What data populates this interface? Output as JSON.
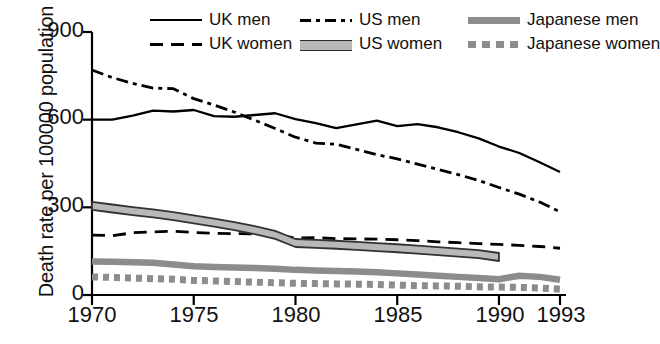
{
  "chart_data": {
    "type": "line",
    "title": "",
    "xlabel": "",
    "ylabel": "Death rate per 100000 population",
    "xlim": [
      1970,
      1993
    ],
    "ylim": [
      0,
      900
    ],
    "yticks": [
      0,
      300,
      600,
      900
    ],
    "xticks": [
      1970,
      1975,
      1980,
      1985,
      1990,
      1993
    ],
    "grid": false,
    "legend_position": "top",
    "series": [
      {
        "name": "UK men",
        "style": "solid",
        "color": "#000000",
        "x": [
          1970,
          1971,
          1972,
          1973,
          1974,
          1975,
          1976,
          1977,
          1978,
          1979,
          1980,
          1981,
          1982,
          1983,
          1984,
          1985,
          1986,
          1987,
          1988,
          1989,
          1990,
          1991,
          1992,
          1993
        ],
        "values": [
          600,
          600,
          614,
          631,
          628,
          633,
          612,
          610,
          616,
          622,
          602,
          588,
          571,
          584,
          597,
          578,
          585,
          574,
          557,
          536,
          508,
          486,
          454,
          421
        ]
      },
      {
        "name": "UK women",
        "style": "dashed",
        "color": "#000000",
        "x": [
          1970,
          1971,
          1972,
          1973,
          1974,
          1975,
          1976,
          1977,
          1978,
          1979,
          1980,
          1981,
          1982,
          1983,
          1984,
          1985,
          1986,
          1987,
          1988,
          1989,
          1990,
          1991,
          1992,
          1993
        ],
        "values": [
          205,
          203,
          213,
          216,
          218,
          214,
          211,
          210,
          209,
          206,
          195,
          196,
          193,
          192,
          191,
          189,
          186,
          182,
          179,
          176,
          173,
          170,
          166,
          160
        ]
      },
      {
        "name": "US men",
        "style": "dashdot",
        "color": "#000000",
        "x": [
          1970,
          1971,
          1972,
          1973,
          1974,
          1975,
          1976,
          1977,
          1978,
          1979,
          1980,
          1981,
          1982,
          1983,
          1984,
          1985,
          1986,
          1987,
          1988,
          1989,
          1990,
          1991,
          1992,
          1993
        ],
        "values": [
          770,
          744,
          724,
          708,
          706,
          672,
          650,
          626,
          598,
          570,
          540,
          520,
          516,
          498,
          480,
          466,
          448,
          430,
          412,
          392,
          368,
          345,
          318,
          285
        ]
      },
      {
        "name": "US women",
        "style": "band",
        "color": "#b8b8b8",
        "x": [
          1970,
          1971,
          1972,
          1973,
          1974,
          1975,
          1976,
          1977,
          1978,
          1979,
          1980,
          1981,
          1982,
          1983,
          1984,
          1985,
          1986,
          1987,
          1988,
          1989,
          1990
        ],
        "values": [
          305,
          296,
          287,
          279,
          270,
          259,
          248,
          236,
          222,
          206,
          178,
          175,
          172,
          168,
          164,
          160,
          155,
          150,
          145,
          140,
          130
        ],
        "band_width": 16
      },
      {
        "name": "Japanese men",
        "style": "thick",
        "color": "#8c8c8c",
        "x": [
          1970,
          1971,
          1972,
          1973,
          1974,
          1975,
          1976,
          1977,
          1978,
          1979,
          1980,
          1981,
          1982,
          1983,
          1984,
          1985,
          1986,
          1987,
          1988,
          1989,
          1990,
          1991,
          1992,
          1993
        ],
        "values": [
          115,
          114,
          112,
          110,
          104,
          98,
          96,
          94,
          92,
          90,
          86,
          84,
          82,
          80,
          78,
          74,
          70,
          66,
          62,
          58,
          54,
          66,
          62,
          52
        ]
      },
      {
        "name": "Japanese women",
        "style": "dotted",
        "color": "#8c8c8c",
        "x": [
          1970,
          1971,
          1972,
          1973,
          1974,
          1975,
          1976,
          1977,
          1978,
          1979,
          1980,
          1981,
          1982,
          1983,
          1984,
          1985,
          1986,
          1987,
          1988,
          1989,
          1990,
          1991,
          1992,
          1993
        ],
        "values": [
          62,
          60,
          58,
          56,
          54,
          50,
          48,
          46,
          44,
          42,
          40,
          39,
          38,
          37,
          36,
          34,
          32,
          31,
          30,
          28,
          27,
          26,
          24,
          20
        ]
      }
    ]
  },
  "axes": {
    "ylabel": "Death rate per 100000 population",
    "ytick_labels": [
      "900",
      "600",
      "300",
      "0"
    ],
    "xtick_labels": [
      "1970",
      "1975",
      "1980",
      "1985",
      "1990",
      "1993"
    ]
  },
  "legend": {
    "items": [
      {
        "label": "UK men",
        "swatch": "line-solid-swatch"
      },
      {
        "label": "US men",
        "swatch": "line-dashdot-swatch"
      },
      {
        "label": "Japanese men",
        "swatch": "line-thick-gray-swatch"
      },
      {
        "label": "UK women",
        "swatch": "line-dashed-swatch"
      },
      {
        "label": "US women",
        "swatch": "line-band-swatch"
      },
      {
        "label": "Japanese women",
        "swatch": "line-dotted-gray-swatch"
      }
    ]
  }
}
